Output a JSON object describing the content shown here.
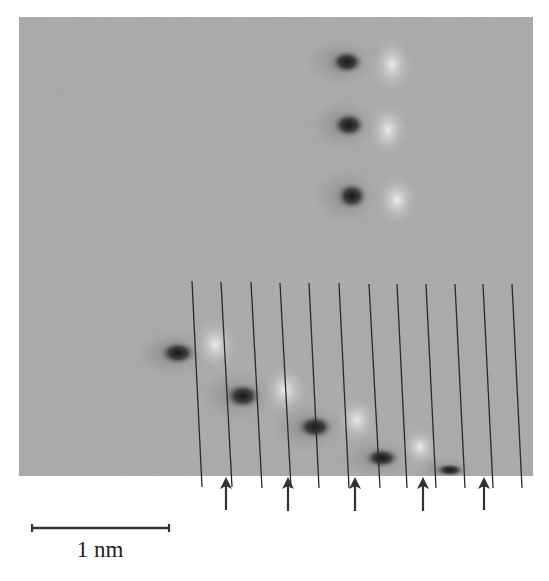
{
  "figure": {
    "type": "STM micrograph",
    "background_gray": "#a9a9a9",
    "image_region": {
      "x": 19,
      "y": 17,
      "width": 514,
      "height": 459
    },
    "dark_spots": [
      {
        "x": 347,
        "y": 62,
        "rx": 18,
        "ry": 13
      },
      {
        "x": 349,
        "y": 125,
        "rx": 18,
        "ry": 14
      },
      {
        "x": 352,
        "y": 196,
        "rx": 17,
        "ry": 15
      },
      {
        "x": 178,
        "y": 353,
        "rx": 20,
        "ry": 13
      },
      {
        "x": 243,
        "y": 396,
        "rx": 20,
        "ry": 14
      },
      {
        "x": 315,
        "y": 427,
        "rx": 20,
        "ry": 13
      },
      {
        "x": 382,
        "y": 458,
        "rx": 19,
        "ry": 11
      },
      {
        "x": 450,
        "y": 470,
        "rx": 16,
        "ry": 7
      }
    ],
    "bright_spots": [
      {
        "x": 392,
        "y": 65,
        "rx": 22,
        "ry": 30
      },
      {
        "x": 388,
        "y": 130,
        "rx": 22,
        "ry": 28
      },
      {
        "x": 397,
        "y": 200,
        "rx": 22,
        "ry": 28
      },
      {
        "x": 215,
        "y": 345,
        "rx": 25,
        "ry": 28
      },
      {
        "x": 285,
        "y": 390,
        "rx": 25,
        "ry": 28
      },
      {
        "x": 357,
        "y": 420,
        "rx": 22,
        "ry": 25
      },
      {
        "x": 420,
        "y": 447,
        "rx": 20,
        "ry": 22
      }
    ],
    "guide_lines": [
      {
        "x1": 192,
        "y1": 281,
        "x2": 202,
        "y2": 487
      },
      {
        "x1": 221,
        "y1": 282,
        "x2": 232,
        "y2": 487
      },
      {
        "x1": 251,
        "y1": 282,
        "x2": 262,
        "y2": 488
      },
      {
        "x1": 280,
        "y1": 283,
        "x2": 291,
        "y2": 488
      },
      {
        "x1": 309,
        "y1": 283,
        "x2": 319,
        "y2": 488
      },
      {
        "x1": 339,
        "y1": 283,
        "x2": 349,
        "y2": 488
      },
      {
        "x1": 369,
        "y1": 284,
        "x2": 380,
        "y2": 488
      },
      {
        "x1": 397,
        "y1": 284,
        "x2": 407,
        "y2": 488
      },
      {
        "x1": 426,
        "y1": 284,
        "x2": 436,
        "y2": 488
      },
      {
        "x1": 455,
        "y1": 284,
        "x2": 465,
        "y2": 488
      },
      {
        "x1": 483,
        "y1": 284,
        "x2": 493,
        "y2": 488
      },
      {
        "x1": 512,
        "y1": 284,
        "x2": 522,
        "y2": 488
      }
    ],
    "arrows": [
      {
        "x": 226,
        "y_tip": 477,
        "y_tail": 510
      },
      {
        "x": 288,
        "y_tip": 477,
        "y_tail": 511
      },
      {
        "x": 355,
        "y_tip": 477,
        "y_tail": 511
      },
      {
        "x": 423,
        "y_tip": 477,
        "y_tail": 511
      },
      {
        "x": 484,
        "y_tip": 477,
        "y_tail": 510
      }
    ],
    "scale_bar": {
      "x1": 32,
      "x2": 169,
      "y": 528,
      "label": "1 nm"
    }
  }
}
